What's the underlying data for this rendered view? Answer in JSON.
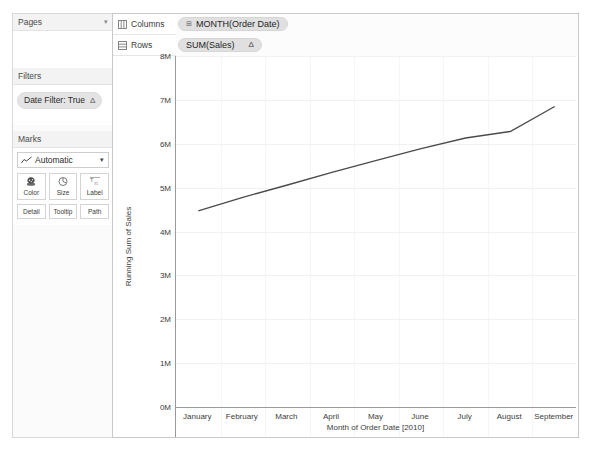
{
  "left_panel": {
    "pages": {
      "title": "Pages",
      "caret": "chevron-down"
    },
    "filters": {
      "title": "Filters",
      "pills": [
        {
          "label": "Date Filter: True",
          "badge": "Δ"
        }
      ]
    },
    "marks": {
      "title": "Marks",
      "mark_type": "Automatic",
      "mark_type_icon": "line-chart-icon",
      "buttons": [
        {
          "label": "Color",
          "icon": "color-palette-icon"
        },
        {
          "label": "Size",
          "icon": "size-gauge-icon"
        },
        {
          "label": "Label",
          "icon": "label-text-icon"
        }
      ],
      "buttons_row2": [
        {
          "label": "Detail",
          "icon": "detail-icon"
        },
        {
          "label": "Tooltip",
          "icon": "tooltip-icon"
        },
        {
          "label": "Path",
          "icon": "path-icon"
        }
      ]
    }
  },
  "shelves": [
    {
      "name": "Columns",
      "icon": "columns-icon",
      "pill": {
        "prefix": "⊞",
        "label": "MONTH(Order Date)",
        "badge": ""
      }
    },
    {
      "name": "Rows",
      "icon": "rows-icon",
      "pill": {
        "prefix": "",
        "label": "SUM(Sales)",
        "badge": "Δ"
      }
    }
  ],
  "colors": {
    "line": "#4a4a4a",
    "axis": "#9a9a9a",
    "grid": "#f2f2f2",
    "pill": "#e0e0e0",
    "panel_bg": "#fbfbfb"
  },
  "chart_data": {
    "type": "line",
    "title": "",
    "xlabel": "Month of Order Date [2010]",
    "ylabel": "Running Sum of Sales",
    "categories": [
      "January",
      "February",
      "March",
      "April",
      "May",
      "June",
      "July",
      "August",
      "September"
    ],
    "x": [
      "January",
      "February",
      "March",
      "April",
      "May",
      "June",
      "July",
      "August",
      "September"
    ],
    "values": [
      4.47,
      4.78,
      5.06,
      5.35,
      5.62,
      5.89,
      6.13,
      6.28,
      6.85
    ],
    "value_unit": "M",
    "ylim": [
      0,
      8
    ],
    "yticks": [
      0,
      1,
      2,
      3,
      4,
      5,
      6,
      7,
      8
    ],
    "ytick_labels": [
      "0M",
      "1M",
      "2M",
      "3M",
      "4M",
      "5M",
      "6M",
      "7M",
      "8M"
    ],
    "grid": true,
    "legend": "none",
    "series": [
      {
        "name": "Running Sum of Sales",
        "values": [
          4.47,
          4.78,
          5.06,
          5.35,
          5.62,
          5.89,
          6.13,
          6.28,
          6.85
        ]
      }
    ]
  }
}
